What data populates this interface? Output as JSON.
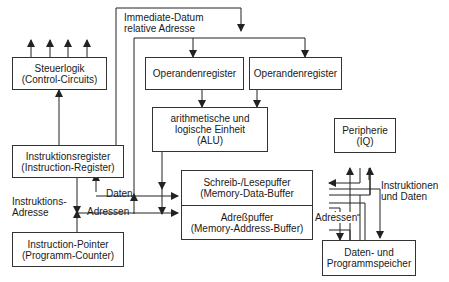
{
  "diagram": {
    "blocks": {
      "control": {
        "line1": "Steuerlogik",
        "line2": "(Control-Circuits)"
      },
      "opreg1": {
        "line1": "Operandenregister"
      },
      "opreg2": {
        "line1": "Operandenregister"
      },
      "alu": {
        "line1": "arithmetische und",
        "line2": "logische Einheit",
        "line3": "(ALU)"
      },
      "ir": {
        "line1": "Instruktionsregister",
        "line2": "(Instruction-Register)"
      },
      "mdb": {
        "line1": "Schreib-/Lesepuffer",
        "line2": "(Memory-Data-Buffer"
      },
      "mab": {
        "line1": "Adreßpuffer",
        "line2": "(Memory-Address-Buffer)"
      },
      "ip": {
        "line1": "Instruction-Pointer",
        "line2": "(Programm-Counter)"
      },
      "periph": {
        "line1": "Peripherie",
        "line2": "(IQ)"
      },
      "memory": {
        "line1": "Daten- und",
        "line2": "Programmspeicher"
      }
    },
    "labels": {
      "immediate_line1": "Immediate-Datum",
      "immediate_line2": "relative Adresse",
      "daten": "Daten",
      "adressen_left": "Adressen",
      "instr_addr_line1": "Instruktions-",
      "instr_addr_line2": "Adresse",
      "adressen_right": "Adressen",
      "instr_daten_line1": "Instruktionen",
      "instr_daten_line2": "und Daten"
    },
    "colors": {
      "line": "#222222",
      "background": "#ffffff"
    }
  }
}
